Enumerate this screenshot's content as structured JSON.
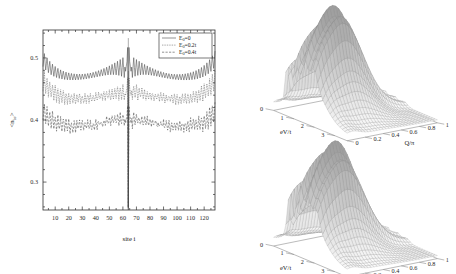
{
  "figure": {
    "background": "#ffffff",
    "ink_color": "#2a2a2a",
    "mesh_color": "#7a7a7a"
  },
  "chart_data": [
    {
      "id": "site-occupation",
      "type": "line",
      "title": "",
      "xlabel": "site i",
      "ylabel": "<n_iσ>",
      "ylabel_parts": {
        "prefix": "<n",
        "sub": "iσ",
        "suffix": ">"
      },
      "xlim": [
        1,
        128
      ],
      "ylim": [
        0.255,
        0.545
      ],
      "xticks": [
        10,
        20,
        30,
        40,
        50,
        60,
        70,
        80,
        90,
        100,
        110,
        120
      ],
      "xticklabels": [
        "10",
        "20",
        "30",
        "40",
        "50",
        "60",
        "70",
        "80",
        "90",
        "100",
        "110",
        "120"
      ],
      "yticks": [
        0.3,
        0.4,
        0.5
      ],
      "yticklabels": [
        "0.3",
        "0.4",
        "0.5"
      ],
      "grid": false,
      "legend_position": "top-right",
      "impurity_site": 64,
      "series": [
        {
          "name": "E_0=0",
          "label_prefix": "E",
          "label_sub": "0",
          "label_suffix": "=0",
          "dash": "none",
          "baseline": 0.4655,
          "edge_value": 0.4985,
          "peak_value": 0.532,
          "dip_value": 0.261,
          "amplitude": 0.0048,
          "envelope_decay": 22,
          "center_amp": 0.021,
          "center_decay": 11,
          "noise": 0.0
        },
        {
          "name": "E_0=0.2t",
          "label_prefix": "E",
          "label_sub": "0",
          "label_suffix": "=0.2t",
          "dash": "dotted",
          "baseline": 0.4305,
          "edge_value": 0.464,
          "peak_value": 0.479,
          "dip_value": 0.261,
          "amplitude": 0.0062,
          "envelope_decay": 30,
          "center_amp": 0.015,
          "center_decay": 10,
          "noise": 0.003
        },
        {
          "name": "E_0=0.4t",
          "label_prefix": "E",
          "label_sub": "0",
          "label_suffix": "=0.4t",
          "dash": "dashed",
          "baseline": 0.387,
          "edge_value": 0.413,
          "peak_value": 0.433,
          "dip_value": 0.261,
          "amplitude": 0.0058,
          "envelope_decay": 34,
          "center_amp": 0.012,
          "center_decay": 9,
          "noise": 0.0042
        }
      ]
    },
    {
      "id": "surface-top",
      "type": "surface",
      "title": "",
      "xlabel": "eV/t",
      "ylabel": "Q/π",
      "zlabel": "",
      "xticks": [
        0,
        1,
        2,
        3
      ],
      "xticklabels": [
        "0",
        "1",
        "2",
        "3"
      ],
      "yticks": [
        0,
        0.2,
        0.4,
        0.6,
        0.8,
        1
      ],
      "yticklabels": [
        "0",
        "0.2",
        "0.4",
        "0.6",
        "0.8",
        "1"
      ],
      "xlim": [
        0,
        3.6
      ],
      "ylim": [
        0,
        1
      ],
      "grid": true,
      "ridge_positions": [
        0.18,
        0.3,
        0.42,
        0.55
      ],
      "peak_height": 1.0,
      "nx": 30,
      "ny": 30
    },
    {
      "id": "surface-bottom",
      "type": "surface",
      "title": "",
      "xlabel": "eV/t",
      "ylabel": "Q/π",
      "zlabel": "",
      "xticks": [
        0,
        1,
        2,
        3
      ],
      "xticklabels": [
        "0",
        "1",
        "2",
        "3"
      ],
      "yticks": [
        0,
        0.2,
        0.4,
        0.6,
        0.8,
        1
      ],
      "yticklabels": [
        "0",
        "0.2",
        "0.4",
        "0.6",
        "0.8",
        "1"
      ],
      "xlim": [
        0,
        3.6
      ],
      "ylim": [
        0,
        1
      ],
      "grid": true,
      "ridge_positions": [
        0.2,
        0.33,
        0.46,
        0.58
      ],
      "peak_height": 0.95,
      "nx": 30,
      "ny": 30
    }
  ]
}
